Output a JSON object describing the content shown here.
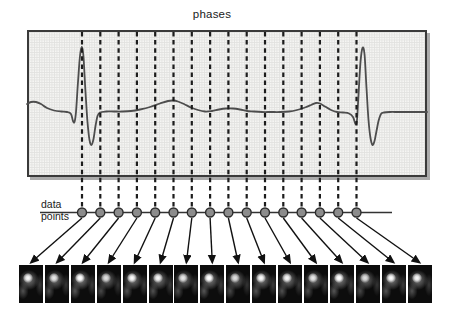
{
  "figure": {
    "title": "phases",
    "data_points_label": {
      "line1": "data",
      "line2": "points"
    },
    "phase_count": 16,
    "data_point_count": 16,
    "image_count": 16
  },
  "geometry": {
    "canvas": {
      "width": 454,
      "height": 317
    },
    "ecg_box": {
      "x": 27,
      "y": 30,
      "width": 400,
      "height": 147
    },
    "dashes": {
      "first_x": 82,
      "spacing": 18.3,
      "count": 16,
      "top_y": 32,
      "bottom_y": 208
    },
    "data_line": {
      "x1": 40,
      "x2": 392,
      "y": 212.5
    },
    "points": {
      "y": 212.5,
      "radius": 4.5
    },
    "arrows": {
      "start_y": 218,
      "end_y": 262.5
    },
    "images": {
      "count": 16,
      "first_left": 19,
      "spacing": 25.9,
      "top": 265,
      "width": 24,
      "height": 38
    }
  },
  "ecg_trace": [
    [
      27,
      104
    ],
    [
      31,
      102
    ],
    [
      36,
      102
    ],
    [
      41,
      104
    ],
    [
      47,
      108
    ],
    [
      54,
      110.5
    ],
    [
      61,
      111.5
    ],
    [
      67,
      112
    ],
    [
      71,
      114
    ],
    [
      73,
      121
    ],
    [
      74.5,
      122
    ],
    [
      76,
      112
    ],
    [
      78,
      82
    ],
    [
      80,
      56
    ],
    [
      82,
      47
    ],
    [
      83.5,
      57
    ],
    [
      85.5,
      92
    ],
    [
      87.5,
      122
    ],
    [
      89.5,
      140
    ],
    [
      91.5,
      145
    ],
    [
      93.5,
      139
    ],
    [
      95.5,
      126
    ],
    [
      97.5,
      116
    ],
    [
      100,
      112.5
    ],
    [
      106,
      111.5
    ],
    [
      114,
      111.5
    ],
    [
      122,
      111.5
    ],
    [
      131,
      111
    ],
    [
      140,
      109.5
    ],
    [
      150,
      107
    ],
    [
      160,
      103.5
    ],
    [
      168,
      101
    ],
    [
      173,
      100.5
    ],
    [
      178,
      101.5
    ],
    [
      184,
      104
    ],
    [
      191,
      107.5
    ],
    [
      198,
      110
    ],
    [
      205,
      111.5
    ],
    [
      212,
      111
    ],
    [
      219,
      109.5
    ],
    [
      226,
      108.5
    ],
    [
      233,
      108.5
    ],
    [
      240,
      109.5
    ],
    [
      247,
      111
    ],
    [
      254,
      111.5
    ],
    [
      262,
      112
    ],
    [
      271,
      112
    ],
    [
      280,
      112
    ],
    [
      289,
      111.5
    ],
    [
      297,
      110
    ],
    [
      305,
      107.5
    ],
    [
      311,
      105
    ],
    [
      316,
      103
    ],
    [
      320,
      103.5
    ],
    [
      325,
      106.5
    ],
    [
      331,
      110
    ],
    [
      337,
      112
    ],
    [
      343,
      112.5
    ],
    [
      349,
      113.5
    ],
    [
      353,
      117
    ],
    [
      355.5,
      124
    ],
    [
      357,
      120
    ],
    [
      358.5,
      95
    ],
    [
      360.5,
      62
    ],
    [
      362.5,
      48
    ],
    [
      364.5,
      54
    ],
    [
      366.5,
      88
    ],
    [
      368.5,
      120
    ],
    [
      370.5,
      138
    ],
    [
      372.5,
      145
    ],
    [
      374.5,
      141
    ],
    [
      376.5,
      131
    ],
    [
      378.5,
      121
    ],
    [
      381,
      114
    ],
    [
      384,
      112.5
    ],
    [
      390,
      112
    ],
    [
      398,
      112
    ],
    [
      408,
      112
    ],
    [
      418,
      112
    ],
    [
      427,
      112
    ]
  ],
  "colors": {
    "background": "#ffffff",
    "box_fill": "#f5f5f3",
    "grid_line": "#e2e2e0",
    "box_border": "#3a3a3a",
    "box_shadow": "#ababab",
    "ecg_trace": "#4d4d4d",
    "dash_line": "#1c1c1c",
    "point_fill": "#8c8c8c",
    "point_stroke": "#2b2b2b",
    "connector": "#333333",
    "arrow": "#111111",
    "label_text": "#1a1a1a"
  }
}
